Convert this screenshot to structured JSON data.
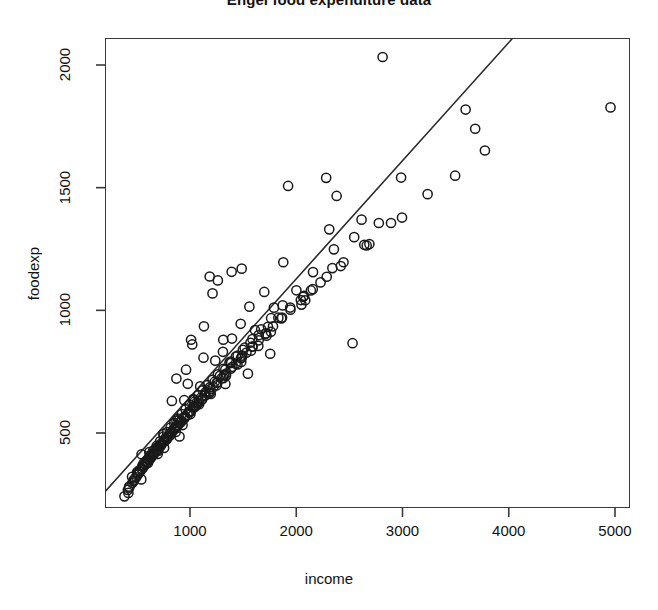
{
  "chart_data": {
    "type": "scatter",
    "title": "Engel food expenditure data",
    "xlabel": "income",
    "ylabel": "foodexp",
    "xlim": [
      200,
      5150
    ],
    "ylim": [
      240,
      2120
    ],
    "grid": false,
    "legend": null,
    "marker": {
      "shape": "open-circle",
      "radius_px": 4.6,
      "stroke": "#1a1a1a",
      "stroke_width_px": 1.5,
      "fill": "none"
    },
    "xticks": [
      1000,
      2000,
      3000,
      4000,
      5000
    ],
    "yticks": [
      500,
      1000,
      1500,
      2000
    ],
    "xtick_labels": [
      "1000",
      "2000",
      "3000",
      "4000",
      "5000"
    ],
    "ytick_labels": [
      "500",
      "1000",
      "1500",
      "2000"
    ],
    "fit_line": {
      "label": "least-squares fit",
      "color": "#2b2b2b",
      "width_px": 1.6,
      "slope": 0.4817,
      "intercept": 165.0,
      "x_start": 200,
      "x_end": 4040,
      "y_start": 261,
      "y_end": 2111
    },
    "n_points": 235,
    "points": [
      [
        420.2,
        255.8
      ],
      [
        541.4,
        310.9
      ],
      [
        901.2,
        485.7
      ],
      [
        639.1,
        402.9
      ],
      [
        750.9,
        495.6
      ],
      [
        945.8,
        633.8
      ],
      [
        829.4,
        630.8
      ],
      [
        979.2,
        700.4
      ],
      [
        1309.9,
        830.9
      ],
      [
        1492.4,
        815.4
      ],
      [
        502.8,
        338.0
      ],
      [
        616.9,
        422.4
      ],
      [
        696.0,
        414.5
      ],
      [
        872.2,
        551.0
      ],
      [
        1044.3,
        627.7
      ],
      [
        544.1,
        413.1
      ],
      [
        622.1,
        404.6
      ],
      [
        702.4,
        443.9
      ],
      [
        783.2,
        474.5
      ],
      [
        899.0,
        554.3
      ],
      [
        1030.8,
        638.3
      ],
      [
        1195.8,
        659.2
      ],
      [
        1381.6,
        790.8
      ],
      [
        1611.7,
        919.6
      ],
      [
        2049.2,
        1023.4
      ],
      [
        454.6,
        321.2
      ],
      [
        502.0,
        339.6
      ],
      [
        554.8,
        368.8
      ],
      [
        604.5,
        378.1
      ],
      [
        654.2,
        415.5
      ],
      [
        702.4,
        427.4
      ],
      [
        755.9,
        439.3
      ],
      [
        809.0,
        489.1
      ],
      [
        865.5,
        504.5
      ],
      [
        930.1,
        532.4
      ],
      [
        1004.1,
        577.1
      ],
      [
        1086.3,
        617.2
      ],
      [
        1185.1,
        663.0
      ],
      [
        1314.2,
        723.7
      ],
      [
        1482.0,
        789.8
      ],
      [
        1720.3,
        896.8
      ],
      [
        2137.5,
        1081.0
      ],
      [
        427.7,
        281.3
      ],
      [
        481.2,
        314.6
      ],
      [
        519.1,
        347.2
      ],
      [
        564.7,
        376.7
      ],
      [
        603.3,
        393.7
      ],
      [
        648.9,
        418.3
      ],
      [
        686.0,
        440.4
      ],
      [
        729.8,
        456.7
      ],
      [
        767.9,
        478.6
      ],
      [
        814.3,
        499.8
      ],
      [
        851.6,
        519.3
      ],
      [
        900.0,
        541.0
      ],
      [
        952.9,
        568.2
      ],
      [
        1005.3,
        589.1
      ],
      [
        1055.6,
        611.5
      ],
      [
        1112.6,
        636.5
      ],
      [
        1180.4,
        662.9
      ],
      [
        1252.4,
        694.3
      ],
      [
        1338.4,
        734.0
      ],
      [
        1446.8,
        779.2
      ],
      [
        1574.0,
        835.6
      ],
      [
        1761.6,
        912.4
      ],
      [
        2084.7,
        1041.2
      ],
      [
        2688.1,
        1270.2
      ],
      [
        383.0,
        241.7
      ],
      [
        428.0,
        277.6
      ],
      [
        469.4,
        303.1
      ],
      [
        508.9,
        330.7
      ],
      [
        546.3,
        351.9
      ],
      [
        582.5,
        372.6
      ],
      [
        618.0,
        391.4
      ],
      [
        653.9,
        410.8
      ],
      [
        688.5,
        428.8
      ],
      [
        723.6,
        447.0
      ],
      [
        759.9,
        466.9
      ],
      [
        796.1,
        486.1
      ],
      [
        832.6,
        505.1
      ],
      [
        870.2,
        524.6
      ],
      [
        908.8,
        543.5
      ],
      [
        949.3,
        564.2
      ],
      [
        991.8,
        585.1
      ],
      [
        1036.4,
        606.6
      ],
      [
        1084.1,
        629.6
      ],
      [
        1135.6,
        653.8
      ],
      [
        1191.9,
        678.9
      ],
      [
        1253.6,
        706.2
      ],
      [
        1322.0,
        736.3
      ],
      [
        1399.0,
        769.7
      ],
      [
        1487.1,
        807.6
      ],
      [
        1590.1,
        852.3
      ],
      [
        1713.6,
        905.1
      ],
      [
        1866.3,
        970.4
      ],
      [
        2064.4,
        1055.0
      ],
      [
        2340.0,
        1172.1
      ],
      [
        2777.2,
        1355.9
      ],
      [
        3684.0,
        1740.2
      ],
      [
        415.3,
        267.9
      ],
      [
        456.8,
        296.1
      ],
      [
        494.1,
        319.5
      ],
      [
        528.9,
        341.7
      ],
      [
        562.6,
        361.4
      ],
      [
        595.2,
        379.7
      ],
      [
        627.2,
        397.3
      ],
      [
        659.0,
        414.7
      ],
      [
        690.5,
        431.4
      ],
      [
        722.1,
        448.1
      ],
      [
        753.8,
        464.9
      ],
      [
        785.7,
        481.6
      ],
      [
        818.1,
        498.5
      ],
      [
        850.8,
        515.3
      ],
      [
        884.1,
        532.5
      ],
      [
        918.1,
        550.0
      ],
      [
        952.9,
        567.8
      ],
      [
        988.6,
        586.0
      ],
      [
        1025.5,
        604.7
      ],
      [
        1063.6,
        624.0
      ],
      [
        1103.1,
        644.0
      ],
      [
        1144.3,
        664.7
      ],
      [
        1187.5,
        686.4
      ],
      [
        1233.0,
        709.1
      ],
      [
        1281.3,
        733.1
      ],
      [
        1332.8,
        758.6
      ],
      [
        1388.2,
        785.9
      ],
      [
        1448.4,
        815.4
      ],
      [
        1514.4,
        847.6
      ],
      [
        1587.6,
        883.1
      ],
      [
        1669.8,
        922.9
      ],
      [
        1763.5,
        968.0
      ],
      [
        1872.4,
        1020.1
      ],
      [
        2001.3,
        1081.6
      ],
      [
        2157.7,
        1155.8
      ],
      [
        2354.5,
        1248.5
      ],
      [
        2614.6,
        1369.7
      ],
      [
        2986.7,
        1541.2
      ],
      [
        3594.1,
        1818.4
      ],
      [
        4957.8,
        1827.2
      ],
      [
        548.5,
        354.1
      ],
      [
        589.7,
        378.7
      ],
      [
        627.0,
        399.5
      ],
      [
        662.0,
        418.2
      ],
      [
        695.4,
        435.5
      ],
      [
        727.8,
        452.0
      ],
      [
        759.5,
        468.0
      ],
      [
        790.8,
        483.5
      ],
      [
        821.8,
        498.8
      ],
      [
        852.7,
        513.9
      ],
      [
        883.6,
        528.9
      ],
      [
        914.6,
        543.9
      ],
      [
        945.9,
        558.9
      ],
      [
        977.5,
        574.0
      ],
      [
        1009.6,
        589.2
      ],
      [
        1042.3,
        604.7
      ],
      [
        1075.7,
        620.4
      ],
      [
        1109.9,
        636.4
      ],
      [
        1145.0,
        652.8
      ],
      [
        1181.2,
        669.6
      ],
      [
        1218.6,
        686.9
      ],
      [
        1257.4,
        704.7
      ],
      [
        1297.7,
        723.1
      ],
      [
        1339.8,
        742.2
      ],
      [
        1383.9,
        762.1
      ],
      [
        1430.3,
        782.9
      ],
      [
        1479.3,
        804.7
      ],
      [
        1531.3,
        827.6
      ],
      [
        1586.8,
        851.9
      ],
      [
        1646.4,
        877.7
      ],
      [
        1710.8,
        905.3
      ],
      [
        1781.2,
        935.0
      ],
      [
        1858.9,
        967.3
      ],
      [
        1945.5,
        1002.7
      ],
      [
        2043.2,
        1042.0
      ],
      [
        2155.5,
        1086.2
      ],
      [
        2287.0,
        1136.8
      ],
      [
        2445.0,
        1196.0
      ],
      [
        2640.4,
        1267.1
      ],
      [
        2891.9,
        1356.0
      ],
      [
        3236.3,
        1473.6
      ],
      [
        3775.7,
        1651.5
      ],
      [
        466.8,
        305.9
      ],
      [
        512.6,
        337.7
      ],
      [
        551.1,
        363.5
      ],
      [
        586.5,
        386.5
      ],
      [
        620.3,
        407.7
      ],
      [
        653.3,
        427.9
      ],
      [
        685.8,
        447.3
      ],
      [
        718.3,
        466.4
      ],
      [
        750.9,
        485.1
      ],
      [
        783.8,
        503.6
      ],
      [
        817.2,
        522.0
      ],
      [
        851.3,
        540.4
      ],
      [
        886.1,
        558.8
      ],
      [
        921.9,
        577.3
      ],
      [
        958.7,
        596.0
      ],
      [
        996.8,
        614.9
      ],
      [
        1036.2,
        634.2
      ],
      [
        1077.2,
        653.9
      ],
      [
        1120.0,
        674.1
      ],
      [
        1164.9,
        694.9
      ],
      [
        1212.1,
        716.4
      ],
      [
        1262.0,
        738.7
      ],
      [
        1314.9,
        761.9
      ],
      [
        1371.4,
        786.2
      ],
      [
        1432.0,
        811.8
      ],
      [
        1497.5,
        838.9
      ],
      [
        1568.7,
        867.8
      ],
      [
        1646.9,
        898.9
      ],
      [
        1733.8,
        932.7
      ],
      [
        1831.6,
        969.9
      ],
      [
        1943.3,
        1011.4
      ],
      [
        2073.4,
        1058.7
      ],
      [
        2228.5,
        1113.9
      ],
      [
        2418.9,
        1180.4
      ],
      [
        2663.0,
        1264.5
      ],
      [
        2995.4,
        1378.2
      ],
      [
        3495.4,
        1548.8
      ],
      [
        2812.8,
        2032.7
      ],
      [
        2530.0,
        866.0
      ],
      [
        1923.3,
        1507.0
      ],
      [
        2281.5,
        1540.0
      ],
      [
        2380.1,
        1466.4
      ],
      [
        2310.5,
        1330.1
      ],
      [
        2545.4,
        1298.3
      ],
      [
        1486.5,
        1170.0
      ],
      [
        1392.0,
        1157.0
      ],
      [
        1185.3,
        1138.0
      ],
      [
        1262.0,
        1122.0
      ],
      [
        1559.0,
        1015.0
      ],
      [
        1699.0,
        1075.0
      ],
      [
        1212.0,
        1069.0
      ],
      [
        1010.0,
        880.0
      ],
      [
        1131.0,
        935.0
      ],
      [
        1477.0,
        945.0
      ],
      [
        1790.0,
        1011.0
      ],
      [
        1878.0,
        1196.0
      ],
      [
        1395.0,
        885.0
      ],
      [
        1643.0,
        855.0
      ],
      [
        1755.0,
        823.0
      ],
      [
        1545.0,
        742.0
      ],
      [
        1333.0,
        700.0
      ],
      [
        1021.0,
        861.0
      ],
      [
        1127.0,
        807.0
      ],
      [
        872.0,
        722.0
      ],
      [
        963.0,
        758.0
      ],
      [
        1238.0,
        795.0
      ],
      [
        1096.0,
        690.0
      ],
      [
        1313.0,
        880.0
      ]
    ]
  },
  "meta": {
    "background": "#ffffff",
    "axis_color": "#3a3a3a",
    "text_color": "#111111"
  }
}
